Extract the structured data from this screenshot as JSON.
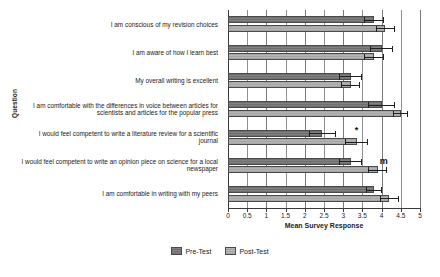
{
  "chart_data": {
    "type": "bar",
    "orientation": "horizontal",
    "title": "",
    "xlabel": "Mean Survey Response",
    "ylabel": "Question",
    "xlim": [
      0,
      5
    ],
    "xticks": [
      "0",
      "0.5",
      "1",
      "1.5",
      "2",
      "2.5",
      "3",
      "3.5",
      "4",
      "4.5",
      "5"
    ],
    "xtick_values": [
      0,
      0.5,
      1,
      1.5,
      2,
      2.5,
      3,
      3.5,
      4,
      4.5,
      5
    ],
    "grid": true,
    "legend_position": "bottom",
    "categories": [
      "I am conscious of my revision choices",
      "I am aware of how I learn best",
      "My overall writing is excellent",
      "I am comfortable with the differences in voice between articles for scientists and articles for the popular press",
      "I would feel competent to write a literature review for a scientific journal",
      "I would feel competent to write an opinion piece on science for a local newspaper",
      "I am comfortable in writing with my peers"
    ],
    "series": [
      {
        "name": "Pre-Test",
        "color": "#7a7a7a",
        "values": [
          3.8,
          4.0,
          3.2,
          4.0,
          2.45,
          3.2,
          3.8
        ],
        "errors": [
          0.25,
          0.3,
          0.3,
          0.35,
          0.35,
          0.3,
          0.2
        ]
      },
      {
        "name": "Post-Test",
        "color": "#adadad",
        "values": [
          4.1,
          3.8,
          3.2,
          4.5,
          3.35,
          3.9,
          4.2
        ],
        "errors": [
          0.25,
          0.25,
          0.25,
          0.2,
          0.3,
          0.25,
          0.25
        ]
      }
    ],
    "annotations": [
      {
        "text": "*",
        "category_index": 4,
        "x": 3.3
      },
      {
        "text": "m",
        "category_index": 5,
        "x": 3.95
      }
    ]
  },
  "legend": {
    "items": [
      {
        "label": "Pre-Test"
      },
      {
        "label": "Post-Test"
      }
    ]
  },
  "caption": {
    "text": ""
  }
}
